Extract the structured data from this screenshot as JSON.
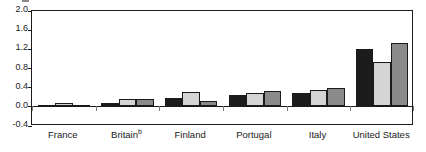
{
  "chart_data": {
    "type": "bar",
    "title": "",
    "subtitle": "",
    "xlabel": "",
    "ylabel": "",
    "ylim": [
      -0.4,
      2.0
    ],
    "ytick_values": [
      2.0,
      1.6,
      1.2,
      0.8,
      0.4,
      0.0,
      -0.4
    ],
    "ytick_labels": [
      "2.0",
      "1.6",
      "1.2",
      "0.8",
      "0.4",
      "0.0",
      "-0.4"
    ],
    "grid": false,
    "legend": "none",
    "categories": [
      "France",
      "Britain",
      "Finland",
      "Portugal",
      "Italy",
      "United States"
    ],
    "category_labels": [
      "France",
      "Britain",
      "Finland",
      "Portugal",
      "Italy",
      "United States"
    ],
    "category_footnotes": [
      "",
      "b",
      "",
      "",
      "",
      ""
    ],
    "series": [
      {
        "name": "series-1",
        "color": "#1c1c1c",
        "values": [
          0.02,
          0.06,
          0.18,
          0.23,
          0.27,
          1.19
        ]
      },
      {
        "name": "series-2",
        "color": "#d5d5d5",
        "values": [
          0.07,
          0.16,
          0.29,
          0.28,
          0.35,
          0.92
        ]
      },
      {
        "name": "series-3",
        "color": "#8a8a8a",
        "values": [
          0.0,
          0.16,
          0.11,
          0.33,
          0.38,
          1.32
        ]
      }
    ]
  },
  "axis": {
    "y_min_label": "-0.4",
    "y_max_label": "2.0"
  },
  "colors": {
    "axis": "#1a1a1a",
    "background": "#ffffff",
    "series_1": "#1c1c1c",
    "series_2": "#d5d5d5",
    "series_3": "#8a8a8a"
  }
}
